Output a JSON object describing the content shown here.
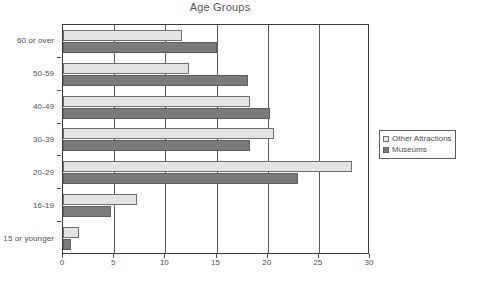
{
  "chart_data": {
    "type": "bar",
    "orientation": "horizontal",
    "title": "Age Groups",
    "xlabel": "",
    "ylabel": "",
    "xlim": [
      0,
      30
    ],
    "ylim": null,
    "grid": true,
    "legend_position": "right",
    "xticks": [
      "0",
      "5",
      "10",
      "15",
      "20",
      "25",
      "30"
    ],
    "xtick_values": [
      0,
      5,
      10,
      15,
      20,
      25,
      30
    ],
    "categories": [
      "15 or younger",
      "16-19",
      "20-29",
      "30-39",
      "40-49",
      "50-59",
      "60 or over"
    ],
    "series": [
      {
        "name": "Other  Attractions",
        "color": "#e3e3e3",
        "values": [
          1.6,
          7.2,
          28.2,
          20.6,
          18.3,
          12.3,
          11.6
        ]
      },
      {
        "name": "Museums",
        "color": "#7b7b7b",
        "values": [
          0.8,
          4.7,
          23.0,
          18.3,
          20.2,
          18.1,
          15.0
        ]
      }
    ]
  },
  "legend": {
    "entries": [
      {
        "label": "Other  Attractions",
        "swatch": "series-other"
      },
      {
        "label": "Museums",
        "swatch": "series-museums"
      }
    ]
  }
}
